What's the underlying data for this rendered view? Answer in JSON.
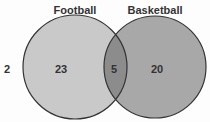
{
  "diagram": {
    "type": "venn",
    "sets": [
      {
        "name": "Football",
        "only_count": "23",
        "color": "#c9c9c9"
      },
      {
        "name": "Basketball",
        "only_count": "20",
        "color": "#a8a8a8"
      }
    ],
    "intersection_count": "5",
    "intersection_color": "#8c8c8c",
    "outside_count": "2",
    "outline_color": "#333333"
  }
}
